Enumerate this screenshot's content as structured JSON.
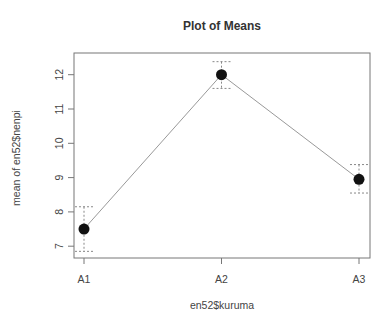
{
  "chart_data": {
    "type": "line",
    "title": "Plot of Means",
    "xlabel": "en52$kuruma",
    "ylabel": "mean of en52$nenpi",
    "categories": [
      "A1",
      "A2",
      "A3"
    ],
    "series": [
      {
        "name": "mean",
        "values": [
          7.5,
          12.0,
          8.95
        ],
        "error_lower": [
          6.85,
          11.6,
          8.55
        ],
        "error_upper": [
          8.15,
          12.38,
          9.38
        ]
      }
    ],
    "yticks": [
      7,
      8,
      9,
      10,
      11,
      12
    ],
    "ylim": [
      6.6,
      12.6
    ],
    "grid": false,
    "legend": null
  },
  "colors": {
    "line": "#999999",
    "point": "#111111",
    "errorbar": "#888888",
    "frame": "#777777"
  }
}
